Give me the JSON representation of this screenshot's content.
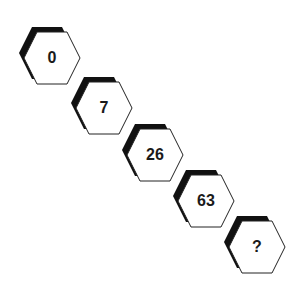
{
  "puzzle": {
    "type": "number-sequence",
    "items": [
      {
        "label": "0"
      },
      {
        "label": "7"
      },
      {
        "label": "26"
      },
      {
        "label": "63"
      },
      {
        "label": "?"
      }
    ]
  },
  "colors": {
    "background": "#ffffff",
    "hex_fill": "#ffffff",
    "hex_stroke": "#222222",
    "shadow": "#111111",
    "text": "#1a1a1a"
  }
}
